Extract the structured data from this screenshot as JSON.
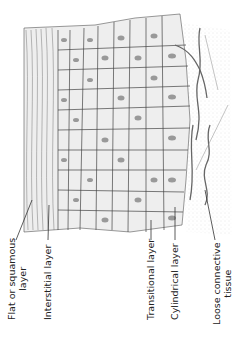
{
  "figure": {
    "colors": {
      "ink": "#333333",
      "cell_fill": "#efefef",
      "nucleus": "#9a9a9a",
      "stipple": "#bdbdbd",
      "background": "#ffffff"
    }
  },
  "labels": [
    {
      "id": "flat",
      "line1": "Flat or squamous",
      "line2": "layer"
    },
    {
      "id": "interstitial",
      "line1": "Interstitial layer"
    },
    {
      "id": "transitional",
      "line1": "Transitional layer"
    },
    {
      "id": "cylindrical",
      "line1": "Cylindrical layer"
    },
    {
      "id": "loose",
      "line1": "Loose connective",
      "line2": "tissue"
    }
  ]
}
